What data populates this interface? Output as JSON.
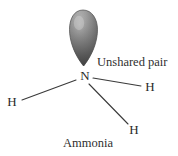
{
  "figure": {
    "name": "ammonia-molecule-diagram",
    "caption": "Ammonia",
    "background_color": "#ffffff",
    "width": 178,
    "height": 156
  },
  "annotations": {
    "unshared_pair_label": "Unshared pair",
    "molecule_name_label": "Ammonia"
  },
  "atoms": [
    {
      "id": "n-center",
      "symbol": "N",
      "x": 85,
      "y": 77
    },
    {
      "id": "h-left",
      "symbol": "H",
      "x": 12,
      "y": 103
    },
    {
      "id": "h-right",
      "symbol": "H",
      "x": 150,
      "y": 88
    },
    {
      "id": "h-bottom",
      "symbol": "H",
      "x": 134,
      "y": 131
    }
  ],
  "bonds": [
    {
      "id": "bond-n-h-left",
      "from": "n-center",
      "to": "h-left",
      "x1": 76,
      "y1": 80,
      "x2": 22,
      "y2": 100
    },
    {
      "id": "bond-n-h-right",
      "from": "n-center",
      "to": "h-right",
      "x1": 93,
      "y1": 78,
      "x2": 141,
      "y2": 86
    },
    {
      "id": "bond-n-h-bottom",
      "from": "n-center",
      "to": "h-bottom",
      "x1": 89,
      "y1": 84,
      "x2": 128,
      "y2": 124
    }
  ],
  "orbital_lobe": {
    "id": "unshared-electron-pair-lobe",
    "description": "teardrop lobe above nitrogen",
    "top_y": 10,
    "tip_y": 66,
    "left_x": 69,
    "right_x": 97,
    "center_x": 83,
    "colors": {
      "highlight": "#b9b9b9",
      "mid": "#8e8e8e",
      "shadow": "#5c5c5c",
      "edge": "#4a4a4a"
    }
  },
  "label_positions": {
    "unshared_pair": {
      "x": 97,
      "y": 62
    },
    "ammonia": {
      "x": 88,
      "y": 143
    }
  },
  "colors": {
    "line": "#3a3a3a",
    "text": "#2a2a2a",
    "caption": "#2f2f2f",
    "background": "#ffffff"
  }
}
